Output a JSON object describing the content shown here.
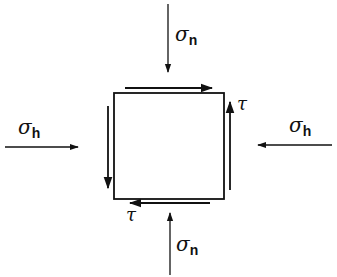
{
  "diagram": {
    "type": "stress-element",
    "colors": {
      "stroke": "#111111",
      "background": "#ffffff"
    },
    "labels": {
      "sigma_n_top": {
        "symbol": "σ",
        "subscript": "n"
      },
      "sigma_n_bottom": {
        "symbol": "σ",
        "subscript": "n"
      },
      "sigma_h_left": {
        "symbol": "σ",
        "subscript": "h"
      },
      "sigma_h_right": {
        "symbol": "σ",
        "subscript": "h"
      },
      "tau_right": "τ",
      "tau_bottom": "τ"
    },
    "arrows": [
      {
        "name": "normal-stress-top",
        "direction": "down"
      },
      {
        "name": "normal-stress-bottom",
        "direction": "up"
      },
      {
        "name": "horizontal-stress-left",
        "direction": "right"
      },
      {
        "name": "horizontal-stress-right",
        "direction": "left"
      },
      {
        "name": "shear-top",
        "direction": "right"
      },
      {
        "name": "shear-right",
        "direction": "up"
      },
      {
        "name": "shear-bottom",
        "direction": "left"
      },
      {
        "name": "shear-left",
        "direction": "down"
      }
    ]
  }
}
